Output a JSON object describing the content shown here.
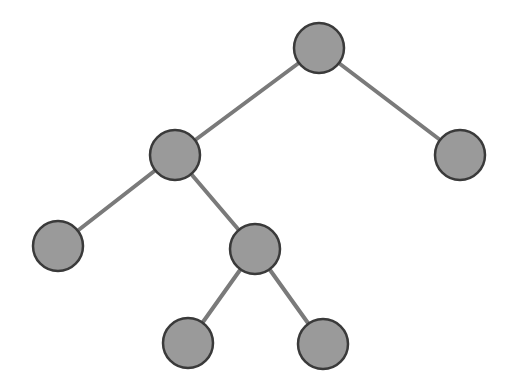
{
  "diagram": {
    "type": "binary-tree",
    "colors": {
      "node_fill": "#9a9a9a",
      "node_stroke": "#3a3a3a",
      "edge": "#7a7a7a",
      "background": "#ffffff"
    },
    "node_radius": 25,
    "nodes": [
      {
        "id": "root",
        "x": 319,
        "y": 48
      },
      {
        "id": "left",
        "x": 175,
        "y": 155
      },
      {
        "id": "right",
        "x": 460,
        "y": 155
      },
      {
        "id": "left-left",
        "x": 58,
        "y": 246
      },
      {
        "id": "left-right",
        "x": 255,
        "y": 249
      },
      {
        "id": "left-right-left",
        "x": 188,
        "y": 343
      },
      {
        "id": "left-right-right",
        "x": 323,
        "y": 344
      }
    ],
    "edges": [
      [
        "root",
        "left"
      ],
      [
        "root",
        "right"
      ],
      [
        "left",
        "left-left"
      ],
      [
        "left",
        "left-right"
      ],
      [
        "left-right",
        "left-right-left"
      ],
      [
        "left-right",
        "left-right-right"
      ]
    ]
  }
}
